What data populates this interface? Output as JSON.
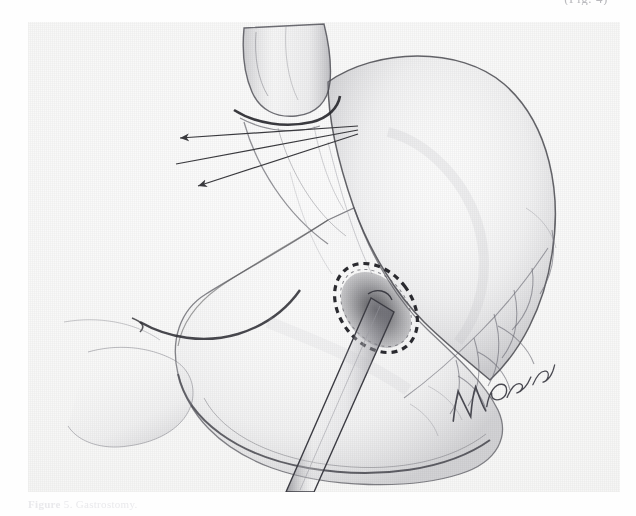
{
  "page": {
    "background_color": "#ffffff",
    "plate_background_color": "#f7f7f6",
    "ink_color": "#3a3a3e",
    "top_cutoff_text": "(Fig. 4)"
  },
  "figure": {
    "kind": "halftone-medical-illustration",
    "caption_label": "Figure",
    "caption_number": "5.",
    "caption_text": "Gastrostomy.",
    "artist_signature": "Netter",
    "annotations": [
      {
        "name": "arrow-upper",
        "label": "",
        "points_to": "esophagogastric junction",
        "from_x": 330,
        "from_y": 104,
        "to_x": 172,
        "to_y": 118
      },
      {
        "name": "arrow-middle",
        "label": "",
        "points_to": "esophagogastric junction",
        "from_x": 330,
        "from_y": 108,
        "to_x": 168,
        "to_y": 140
      },
      {
        "name": "arrow-lower",
        "label": "",
        "points_to": "cardia",
        "from_x": 330,
        "from_y": 112,
        "to_x": 186,
        "to_y": 162
      }
    ],
    "structures": [
      {
        "name": "esophagus",
        "label": "Esophagus"
      },
      {
        "name": "gastroesophageal-junction",
        "label": "Gastroesophageal junction"
      },
      {
        "name": "gastric-fundus",
        "label": "Fundus"
      },
      {
        "name": "gastric-body",
        "label": "Body of stomach"
      },
      {
        "name": "greater-curvature",
        "label": "Greater curvature"
      },
      {
        "name": "lesser-curvature",
        "label": "Lesser curvature"
      },
      {
        "name": "gastroepiploic-vessels",
        "label": "Gastroepiploic vessels"
      },
      {
        "name": "gastrostomy-stoma",
        "label": "Gastrostomy opening"
      },
      {
        "name": "purse-string-suture",
        "label": "Purse-string suture"
      },
      {
        "name": "gastrostomy-catheter",
        "label": "Catheter"
      }
    ]
  }
}
